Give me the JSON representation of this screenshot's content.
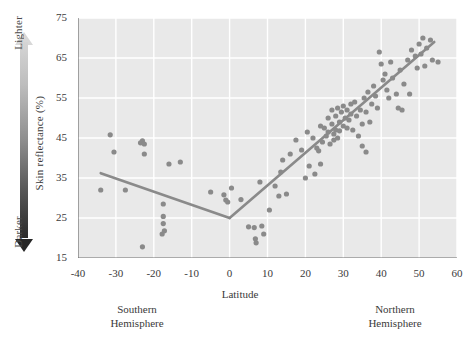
{
  "chart_data": {
    "type": "scatter",
    "title": "",
    "xlabel": "Latitude",
    "ylabel": "Skin reflectance (%)",
    "xlim": [
      -40,
      60
    ],
    "ylim": [
      15,
      75
    ],
    "xticks": [
      -40,
      -30,
      -20,
      -10,
      0,
      10,
      20,
      30,
      40,
      50,
      60
    ],
    "xtick_labels": [
      "-40",
      "-30",
      "-20",
      "-10",
      "0",
      "10",
      "20",
      "30",
      "40",
      "50",
      "60"
    ],
    "xminor_step": 5,
    "yticks": [
      15,
      25,
      35,
      45,
      55,
      65,
      75
    ],
    "ytick_labels": [
      "15",
      "25",
      "35",
      "45",
      "55",
      "65",
      "75"
    ],
    "grid": true,
    "grid_color": "#ffffff",
    "plot_background": "#e9e9e9",
    "point_color": "#8a8a8a",
    "point_radius": 2.6,
    "line_color": "#8a8a8a",
    "line_width": 2.6,
    "axis_color": "#6e6e6e",
    "annotations": {
      "gradient_top_label": "Lighter",
      "gradient_bottom_label": "Darker",
      "gradient_top_color": "#d8d8d8",
      "gradient_bottom_color": "#262626",
      "left_region_label": "Southern\nHemisphere",
      "right_region_label": "Northern\nHemisphere",
      "left_region_line1": "Southern",
      "left_region_line2": "Hemisphere",
      "right_region_line1": "Northern",
      "right_region_line2": "Hemisphere"
    },
    "fit_lines": [
      {
        "name": "southern-segment",
        "points": [
          [
            -34.0,
            36.2
          ],
          [
            0.0,
            25.0
          ]
        ]
      },
      {
        "name": "northern-segment",
        "points": [
          [
            0.0,
            25.0
          ],
          [
            54.0,
            69.0
          ]
        ]
      }
    ],
    "points": [
      [
        -34.0,
        32.0
      ],
      [
        -31.5,
        45.8
      ],
      [
        -30.5,
        41.5
      ],
      [
        -27.5,
        32.0
      ],
      [
        -23.5,
        43.8
      ],
      [
        -23.0,
        44.3
      ],
      [
        -22.5,
        43.5
      ],
      [
        -22.5,
        41.0
      ],
      [
        -23.0,
        17.8
      ],
      [
        -17.5,
        28.5
      ],
      [
        -17.5,
        25.4
      ],
      [
        -17.5,
        23.6
      ],
      [
        -17.2,
        21.8
      ],
      [
        -17.8,
        21.0
      ],
      [
        -16.0,
        38.5
      ],
      [
        -13.0,
        39.0
      ],
      [
        -5.0,
        31.5
      ],
      [
        -1.5,
        30.8
      ],
      [
        -1.0,
        29.5
      ],
      [
        -0.5,
        29.0
      ],
      [
        0.5,
        32.5
      ],
      [
        3.0,
        29.6
      ],
      [
        5.0,
        22.8
      ],
      [
        6.5,
        22.6
      ],
      [
        6.8,
        19.8
      ],
      [
        7.0,
        18.8
      ],
      [
        8.5,
        23.0
      ],
      [
        9.0,
        21.0
      ],
      [
        8.0,
        34.0
      ],
      [
        10.5,
        27.0
      ],
      [
        12.0,
        33.0
      ],
      [
        13.0,
        30.5
      ],
      [
        13.5,
        36.5
      ],
      [
        14.0,
        39.5
      ],
      [
        15.0,
        31.0
      ],
      [
        16.0,
        41.0
      ],
      [
        17.5,
        44.5
      ],
      [
        19.0,
        42.0
      ],
      [
        20.5,
        46.5
      ],
      [
        21.0,
        38.0
      ],
      [
        22.0,
        45.0
      ],
      [
        23.0,
        42.5
      ],
      [
        23.5,
        41.8
      ],
      [
        24.0,
        48.0
      ],
      [
        24.5,
        44.0
      ],
      [
        25.0,
        47.5
      ],
      [
        25.5,
        45.5
      ],
      [
        26.0,
        50.0
      ],
      [
        26.0,
        46.5
      ],
      [
        26.5,
        43.5
      ],
      [
        27.0,
        52.0
      ],
      [
        27.0,
        48.5
      ],
      [
        27.5,
        46.0
      ],
      [
        27.5,
        44.5
      ],
      [
        28.0,
        50.5
      ],
      [
        28.0,
        47.0
      ],
      [
        28.5,
        52.5
      ],
      [
        28.5,
        45.0
      ],
      [
        29.0,
        49.0
      ],
      [
        29.0,
        46.8
      ],
      [
        29.5,
        51.5
      ],
      [
        30.0,
        48.0
      ],
      [
        30.0,
        53.0
      ],
      [
        30.5,
        50.0
      ],
      [
        31.0,
        47.5
      ],
      [
        31.0,
        52.0
      ],
      [
        31.5,
        49.5
      ],
      [
        32.0,
        53.5
      ],
      [
        32.0,
        51.0
      ],
      [
        32.5,
        47.0
      ],
      [
        33.0,
        54.0
      ],
      [
        33.5,
        50.5
      ],
      [
        34.0,
        45.5
      ],
      [
        34.5,
        52.0
      ],
      [
        35.0,
        48.5
      ],
      [
        35.5,
        55.0
      ],
      [
        36.0,
        51.5
      ],
      [
        36.5,
        56.5
      ],
      [
        37.0,
        49.0
      ],
      [
        37.5,
        53.5
      ],
      [
        38.0,
        58.0
      ],
      [
        38.5,
        55.5
      ],
      [
        39.0,
        52.5
      ],
      [
        39.5,
        66.5
      ],
      [
        40.0,
        63.5
      ],
      [
        40.5,
        59.5
      ],
      [
        41.0,
        61.0
      ],
      [
        41.5,
        57.0
      ],
      [
        42.0,
        55.0
      ],
      [
        42.5,
        64.0
      ],
      [
        43.0,
        60.0
      ],
      [
        44.0,
        56.0
      ],
      [
        45.0,
        62.0
      ],
      [
        46.0,
        58.5
      ],
      [
        47.0,
        64.5
      ],
      [
        48.0,
        67.0
      ],
      [
        49.0,
        65.5
      ],
      [
        49.5,
        62.5
      ],
      [
        50.0,
        68.5
      ],
      [
        50.5,
        66.0
      ],
      [
        51.0,
        70.0
      ],
      [
        51.5,
        63.0
      ],
      [
        52.0,
        67.5
      ],
      [
        53.0,
        69.5
      ],
      [
        53.5,
        64.5
      ],
      [
        55.0,
        64.0
      ],
      [
        24.0,
        38.5
      ],
      [
        22.5,
        36.0
      ],
      [
        20.0,
        35.0
      ],
      [
        35.0,
        43.0
      ],
      [
        36.0,
        41.5
      ],
      [
        44.5,
        52.5
      ],
      [
        45.5,
        52.0
      ],
      [
        47.5,
        56.0
      ]
    ]
  }
}
